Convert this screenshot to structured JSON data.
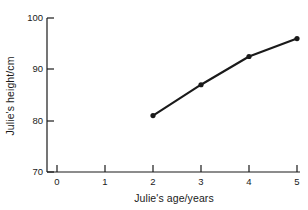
{
  "chart_data": {
    "type": "line",
    "title": "",
    "xlabel": "Julie's age/years",
    "ylabel": "Julie's height/cm",
    "x": [
      2,
      3,
      4,
      5
    ],
    "values": [
      81,
      87,
      92.5,
      96
    ],
    "series": [
      {
        "name": "Julie's height",
        "x": [
          2,
          3,
          4,
          5
        ],
        "values": [
          81,
          87,
          92.5,
          96
        ]
      }
    ],
    "xlim": [
      0,
      5
    ],
    "ylim": [
      70,
      100
    ],
    "xticks": [
      0,
      1,
      2,
      3,
      4,
      5
    ],
    "yticks": [
      70,
      80,
      90,
      100
    ],
    "xtick_labels": [
      "0",
      "1",
      "2",
      "3",
      "4",
      "5"
    ],
    "ytick_labels": [
      "70",
      "80",
      "90",
      "100"
    ],
    "grid": false,
    "legend": "none",
    "marker": "filled-circle",
    "line_color": "#1a1a1a",
    "marker_color": "#1a1a1a",
    "background_color": "#ffffff"
  },
  "axes": {
    "x_label": "Julie's age/years",
    "y_label": "Julie's height/cm",
    "x_ticks": [
      {
        "label": "0",
        "value": 0
      },
      {
        "label": "1",
        "value": 1
      },
      {
        "label": "2",
        "value": 2
      },
      {
        "label": "3",
        "value": 3
      },
      {
        "label": "4",
        "value": 4
      },
      {
        "label": "5",
        "value": 5
      }
    ],
    "y_ticks": [
      {
        "label": "100",
        "value": 100
      },
      {
        "label": "90",
        "value": 90
      },
      {
        "label": "80",
        "value": 80
      },
      {
        "label": "70",
        "value": 70
      }
    ]
  }
}
